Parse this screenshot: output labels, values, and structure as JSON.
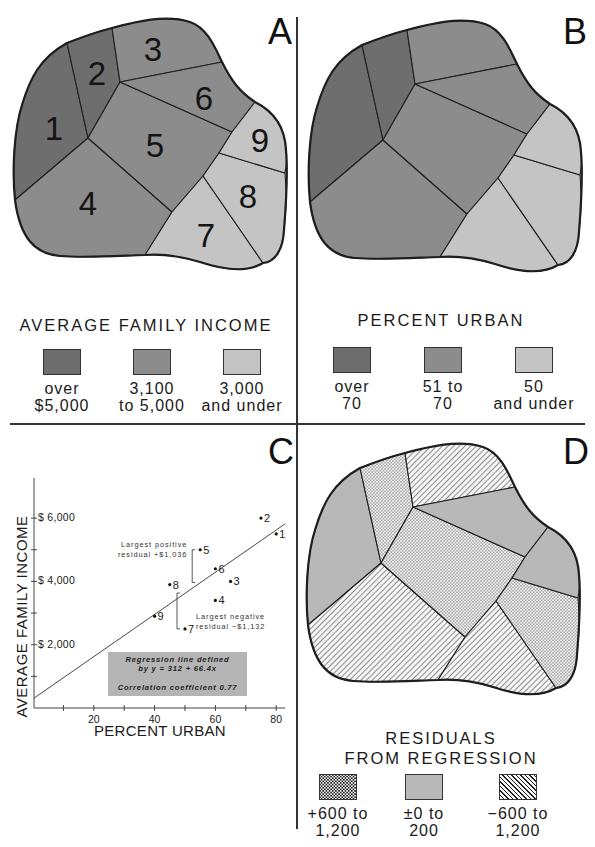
{
  "colors": {
    "dark": "#6e6e6e",
    "medium": "#8c8c8c",
    "light": "#c4c4c4",
    "residual_zero": "#b8b8b8",
    "outline": "#1e1e1e",
    "reg_box": "#b4b4b4"
  },
  "panels": {
    "a": {
      "letter": "A",
      "legend_title": "AVERAGE FAMILY  INCOME",
      "legend": [
        {
          "class": "dark",
          "line1": "over",
          "line2": "$5,000"
        },
        {
          "class": "medium",
          "line1": "3,100",
          "line2": "to 5,000"
        },
        {
          "class": "light",
          "line1": "3,000",
          "line2": "and under"
        }
      ],
      "region_classes": {
        "1": "dark",
        "2": "dark",
        "3": "medium",
        "4": "medium",
        "5": "medium",
        "6": "medium",
        "7": "light",
        "8": "light",
        "9": "light"
      }
    },
    "b": {
      "letter": "B",
      "legend_title": "PERCENT URBAN",
      "legend": [
        {
          "class": "dark",
          "line1": "over",
          "line2": "70"
        },
        {
          "class": "medium",
          "line1": "51 to",
          "line2": "70"
        },
        {
          "class": "light",
          "line1": "50",
          "line2": "and under"
        }
      ],
      "region_classes": {
        "1": "dark",
        "2": "dark",
        "3": "medium",
        "4": "medium",
        "5": "medium",
        "6": "medium",
        "7": "light",
        "8": "light",
        "9": "light"
      }
    },
    "c": {
      "letter": "C",
      "regression_line1": "Regression line defined",
      "regression_line2": "by y = 312 + 66.4x",
      "correlation_text": "Correlation coefficient   0.77",
      "annotation_positive_line1": "Largest positive",
      "annotation_positive_line2": "residual +$1,036",
      "annotation_negative_line1": "Largest negative",
      "annotation_negative_line2": "residual −$1,132"
    },
    "d": {
      "letter": "D",
      "legend_title_line1": "RESIDUALS",
      "legend_title_line2": "FROM REGRESSION",
      "legend": [
        {
          "class": "dots",
          "line1": "+600 to",
          "line2": "1,200"
        },
        {
          "class": "zero",
          "line1": "±0 to",
          "line2": "200"
        },
        {
          "class": "hatch",
          "line1": "−600 to",
          "line2": "1,200"
        }
      ],
      "region_classes": {
        "1": "zero",
        "2": "dots",
        "3": "hatch",
        "4": "hatch",
        "5": "dots",
        "6": "zero",
        "7": "hatch",
        "8": "dots",
        "9": "zero"
      }
    }
  },
  "map_geometry": {
    "outline": "M15,200 C12,170 14,130 22,105 C30,78 40,58 67,43 C85,36 100,31 112,28 C135,22 165,14 190,22 C208,28 216,50 222,62 C232,82 240,92 255,102 C275,112 285,128 286,150 C288,172 286,205 284,230 C283,250 275,262 263,263 C245,274 218,268 200,262 C180,256 160,254 145,255 C115,256 85,258 60,256 C35,254 20,238 15,200 Z",
    "regions": {
      "1": "M15,200 C12,170 14,130 22,105 C30,78 40,58 67,43 L88,138 Z",
      "2": "M67,43 C85,36 100,31 112,28 L120,82 L88,138 Z",
      "3": "M112,28 C135,22 165,14 190,22 C208,28 216,50 222,62 L120,82 Z",
      "4": "M15,200 L88,138 L172,212 L145,255 C115,256 85,258 60,256 C35,254 20,238 15,200 Z",
      "5": "M88,138 L120,82 L232,132 L219,153 L203,176 L172,212 Z",
      "6": "M120,82 L222,62 C232,82 240,92 255,102 L232,132 Z",
      "7": "M172,212 L203,176 L263,263 C245,274 218,268 200,262 C180,256 160,254 145,255 Z",
      "8": "M203,176 L219,153 L285,173 C287,200 286,210 284,230 C283,250 275,262 263,263 Z",
      "9": "M219,153 L232,132 L255,102 C275,112 285,128 286,150 C287,160 286,168 285,173 Z"
    },
    "labels": {
      "1": [
        54,
        128
      ],
      "2": [
        97,
        73
      ],
      "3": [
        153,
        49
      ],
      "4": [
        88,
        203
      ],
      "5": [
        155,
        145
      ],
      "6": [
        204,
        98
      ],
      "7": [
        206,
        235
      ],
      "8": [
        248,
        196
      ],
      "9": [
        260,
        140
      ]
    }
  },
  "chart_data": {
    "type": "scatter",
    "title": "",
    "xlabel": "PERCENT URBAN",
    "ylabel": "AVERAGE FAMILY INCOME",
    "xlim": [
      0,
      80
    ],
    "ylim": [
      0,
      6500
    ],
    "x_ticks": [
      10,
      20,
      30,
      40,
      50,
      60,
      70,
      80
    ],
    "x_tick_labels": [
      "",
      "20",
      "",
      "40",
      "",
      "60",
      "",
      "80"
    ],
    "y_ticks": [
      1000,
      2000,
      3000,
      4000,
      5000,
      6000
    ],
    "y_tick_labels": [
      "",
      "$ 2,000",
      "",
      "$ 4,000",
      "",
      "$ 6,000"
    ],
    "grid": false,
    "points": [
      {
        "label": "1",
        "x": 80,
        "y": 5500
      },
      {
        "label": "2",
        "x": 75,
        "y": 6000
      },
      {
        "label": "3",
        "x": 65,
        "y": 4000
      },
      {
        "label": "4",
        "x": 60,
        "y": 3400
      },
      {
        "label": "5",
        "x": 55,
        "y": 5000
      },
      {
        "label": "6",
        "x": 60,
        "y": 4400
      },
      {
        "label": "7",
        "x": 50,
        "y": 2500
      },
      {
        "label": "8",
        "x": 45,
        "y": 3900
      },
      {
        "label": "9",
        "x": 40,
        "y": 2900
      }
    ],
    "regression": {
      "intercept": 312,
      "slope": 66.4,
      "x_range": [
        0,
        83
      ],
      "equation": "y = 312 + 66.4x",
      "correlation": 0.77
    },
    "annotations": [
      {
        "text": "Largest positive residual +$1,036",
        "point": "5"
      },
      {
        "text": "Largest negative residual −$1,132",
        "point": "7"
      }
    ]
  }
}
